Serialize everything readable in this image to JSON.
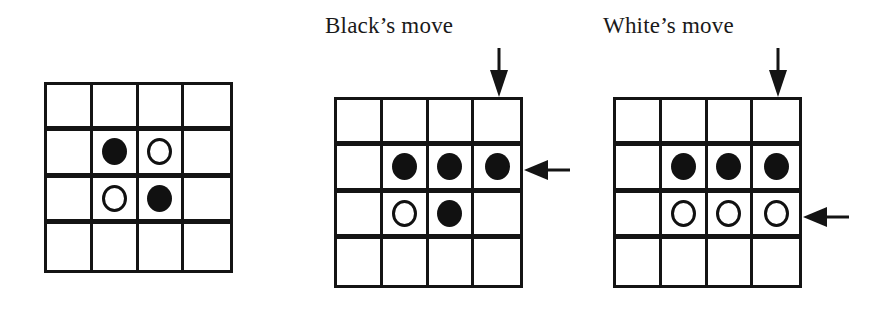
{
  "figure": {
    "panels": [
      {
        "id": "initial",
        "caption": "",
        "board": [
          [
            "",
            "",
            "",
            ""
          ],
          [
            "",
            "black",
            "white",
            ""
          ],
          [
            "",
            "white",
            "black",
            ""
          ],
          [
            "",
            "",
            "",
            ""
          ]
        ],
        "arrows": []
      },
      {
        "id": "black-move",
        "caption": "Black’s move",
        "board": [
          [
            "",
            "",
            "",
            ""
          ],
          [
            "",
            "black",
            "black",
            "black"
          ],
          [
            "",
            "white",
            "black",
            ""
          ],
          [
            "",
            "",
            "",
            ""
          ]
        ],
        "arrows": [
          {
            "direction": "down",
            "target": "column 4 (top)"
          },
          {
            "direction": "left",
            "target": "row 2 (right)"
          }
        ]
      },
      {
        "id": "white-move",
        "caption": "White’s move",
        "board": [
          [
            "",
            "",
            "",
            ""
          ],
          [
            "",
            "black",
            "black",
            "black"
          ],
          [
            "",
            "white",
            "white",
            "white"
          ],
          [
            "",
            "",
            "",
            ""
          ]
        ],
        "arrows": [
          {
            "direction": "down",
            "target": "column 4 (top)"
          },
          {
            "direction": "left",
            "target": "row 3 (right)"
          }
        ]
      }
    ],
    "colors": {
      "line": "#141414",
      "black_disc": "#111111",
      "white_disc_fill": "#ffffff",
      "background": "#ffffff"
    }
  }
}
